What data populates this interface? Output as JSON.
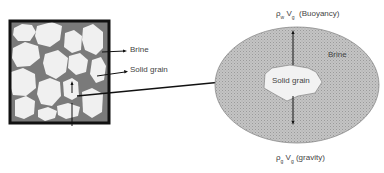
{
  "diagram": {
    "left_panel": {
      "label_brine": "Brine",
      "label_solid_grain": "Solid grain",
      "colors": {
        "brine": "#7a7a7a",
        "grain": "#f0f0f0",
        "border": "#111111"
      }
    },
    "right_panel": {
      "label_brine": "Brine",
      "label_solid_grain": "Solid grain",
      "buoyancy": {
        "rho": "ρ",
        "rho_sub": "w",
        "v": "V",
        "v_sub": "g",
        "desc": "(Buoyancy)"
      },
      "gravity": {
        "rho": "ρ",
        "rho_sub": "g",
        "v": "V",
        "v_sub": "g",
        "desc": "(gravity)"
      },
      "colors": {
        "ellipse_fill": "#b8b8b8",
        "grain": "#f2f2f2"
      }
    }
  }
}
